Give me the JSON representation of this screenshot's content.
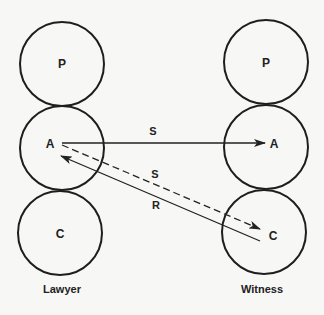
{
  "diagram": {
    "colors": {
      "background": "#f7f7f5",
      "stroke": "#1e1e1e",
      "text": "#222222"
    },
    "columns": [
      {
        "id": "lawyer",
        "caption": "Lawyer",
        "nodes": [
          {
            "id": "lawyer-p",
            "label": "P"
          },
          {
            "id": "lawyer-a",
            "label": "A"
          },
          {
            "id": "lawyer-c",
            "label": "C"
          }
        ]
      },
      {
        "id": "witness",
        "caption": "Witness",
        "nodes": [
          {
            "id": "witness-p",
            "label": "P"
          },
          {
            "id": "witness-a",
            "label": "A"
          },
          {
            "id": "witness-c",
            "label": "C"
          }
        ]
      }
    ],
    "edges": [
      {
        "id": "edge-a-to-a",
        "from": "lawyer-a",
        "to": "witness-a",
        "label": "S",
        "style": "solid"
      },
      {
        "id": "edge-a-to-c",
        "from": "lawyer-a",
        "to": "witness-c",
        "label": "S",
        "style": "dashed"
      },
      {
        "id": "edge-c-to-a",
        "from": "witness-c",
        "to": "lawyer-a",
        "label": "R",
        "style": "solid"
      }
    ]
  }
}
